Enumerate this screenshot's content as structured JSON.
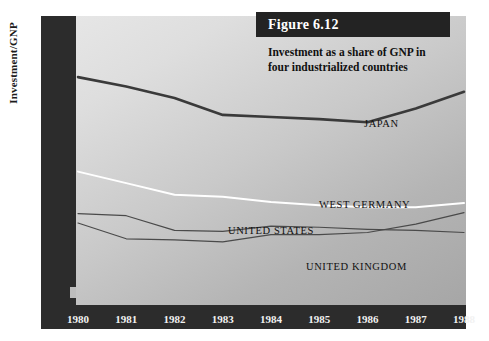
{
  "figure": {
    "number_label": "Figure 6.12",
    "subtitle_line1": "Investment as a share of GNP in",
    "subtitle_line2": "four industrialized countries"
  },
  "axes": {
    "ylabel": "Investment/GNP",
    "ytick_labels": [
      "0.34",
      "0.30",
      "0.26",
      "0.22",
      "0.18",
      "0.14",
      "0"
    ],
    "xtick_labels": [
      "1980",
      "1981",
      "1982",
      "1983",
      "1984",
      "1985",
      "1986",
      "1987",
      "1988"
    ]
  },
  "series_labels": {
    "japan": "JAPAN",
    "west_germany": "WEST GERMANY",
    "united_states": "UNITED STATES",
    "united_kingdom": "UNITED KINGDOM"
  },
  "colors": {
    "axis_band": "#2c2c2c",
    "figure_box": "#232323",
    "japan_line": "#3a3a3a",
    "west_germany_line": "#ffffff",
    "united_states_line": "#4a4a4a",
    "united_kingdom_line": "#4a4a4a",
    "plot_light": "#e6e6e6",
    "plot_dark": "#a6a6a6"
  },
  "chart_data": {
    "type": "line",
    "title": "Investment as a share of GNP in four industrialized countries",
    "subtitle": "Figure 6.12",
    "xlabel": "",
    "ylabel": "Investment/GNP",
    "x": [
      1980,
      1981,
      1982,
      1983,
      1984,
      1985,
      1986,
      1987,
      1988
    ],
    "xlim": [
      1980,
      1988
    ],
    "ylim": [
      0.12,
      0.36
    ],
    "ytick_values": [
      0.34,
      0.3,
      0.26,
      0.22,
      0.18,
      0.14,
      0
    ],
    "y_axis_break": true,
    "grid": false,
    "legend": "inline-labels",
    "series": [
      {
        "name": "JAPAN",
        "color": "#3a3a3a",
        "values": [
          0.318,
          0.309,
          0.298,
          0.282,
          0.28,
          0.278,
          0.275,
          0.288,
          0.304
        ]
      },
      {
        "name": "WEST GERMANY",
        "color": "#ffffff",
        "values": [
          0.228,
          0.217,
          0.206,
          0.204,
          0.199,
          0.196,
          0.194,
          0.194,
          0.198
        ]
      },
      {
        "name": "UNITED STATES",
        "color": "#4a4a4a",
        "values": [
          0.188,
          0.186,
          0.172,
          0.171,
          0.176,
          0.175,
          0.173,
          0.172,
          0.17
        ]
      },
      {
        "name": "UNITED KINGDOM",
        "color": "#4a4a4a",
        "values": [
          0.179,
          0.164,
          0.163,
          0.161,
          0.168,
          0.168,
          0.17,
          0.178,
          0.189
        ]
      }
    ]
  }
}
